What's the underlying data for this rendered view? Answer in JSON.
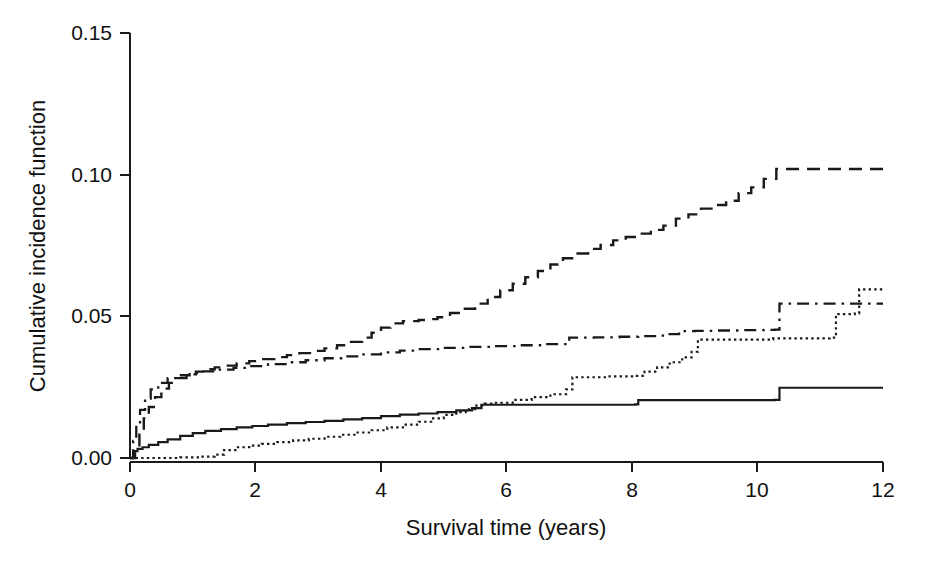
{
  "chart_data": {
    "type": "line",
    "title": "",
    "subtitle": "",
    "xlabel": "Survival time (years)",
    "ylabel": "Cumulative incidence function",
    "xlim": [
      0,
      12
    ],
    "ylim": [
      0.0,
      0.15
    ],
    "xticks": [
      0,
      2,
      4,
      6,
      8,
      10,
      12
    ],
    "xtick_labels": [
      "0",
      "2",
      "4",
      "6",
      "8",
      "10",
      "12"
    ],
    "yticks": [
      0.0,
      0.05,
      0.1,
      0.15
    ],
    "ytick_labels": [
      "0.00",
      "0.05",
      "0.10",
      "0.15"
    ],
    "grid": false,
    "legend": null,
    "legend_position": "none",
    "step_style": "post",
    "series": [
      {
        "name": "series-dashed",
        "line_style": "dashed",
        "color": "#1a1a1a",
        "final_value": 0.102,
        "x": [
          0,
          0.08,
          0.15,
          0.22,
          0.3,
          0.4,
          0.5,
          0.62,
          0.75,
          0.9,
          1.05,
          1.2,
          1.35,
          1.5,
          1.7,
          1.9,
          2.1,
          2.3,
          2.5,
          2.7,
          2.9,
          3.1,
          3.3,
          3.5,
          3.7,
          3.85,
          4.0,
          4.15,
          4.35,
          4.6,
          4.75,
          4.9,
          5.1,
          5.3,
          5.5,
          5.7,
          5.9,
          6.1,
          6.3,
          6.5,
          6.7,
          6.9,
          7.1,
          7.3,
          7.5,
          7.7,
          7.9,
          8.1,
          8.3,
          8.5,
          8.7,
          8.9,
          9.1,
          9.3,
          9.5,
          9.7,
          9.9,
          10.1,
          10.3,
          12
        ],
        "y": [
          0.0,
          0.004,
          0.009,
          0.014,
          0.018,
          0.0215,
          0.0245,
          0.0265,
          0.0282,
          0.0295,
          0.0305,
          0.0313,
          0.032,
          0.0326,
          0.0334,
          0.0342,
          0.0349,
          0.0356,
          0.0363,
          0.037,
          0.0378,
          0.0387,
          0.0398,
          0.041,
          0.0425,
          0.0442,
          0.046,
          0.0475,
          0.0483,
          0.0487,
          0.049,
          0.0497,
          0.0512,
          0.0527,
          0.0545,
          0.0568,
          0.0592,
          0.0615,
          0.0638,
          0.066,
          0.0683,
          0.0705,
          0.0722,
          0.0738,
          0.0752,
          0.0768,
          0.078,
          0.0792,
          0.0805,
          0.082,
          0.0845,
          0.086,
          0.088,
          0.0893,
          0.0908,
          0.0935,
          0.0955,
          0.0985,
          0.102,
          0.102
        ]
      },
      {
        "name": "series-dashdot",
        "line_style": "dashdot",
        "color": "#1a1a1a",
        "final_value": 0.0545,
        "x": [
          0,
          0.05,
          0.1,
          0.16,
          0.24,
          0.33,
          0.45,
          0.6,
          0.75,
          0.95,
          1.15,
          1.4,
          1.65,
          1.9,
          2.2,
          2.5,
          2.8,
          3.1,
          3.4,
          3.7,
          4.0,
          4.3,
          4.6,
          5.0,
          5.4,
          5.8,
          6.2,
          6.6,
          7.0,
          7.4,
          7.8,
          8.1,
          8.4,
          8.6,
          8.75,
          9.0,
          9.3,
          9.7,
          10.1,
          10.28,
          10.35,
          12
        ],
        "y": [
          0.0,
          0.006,
          0.012,
          0.017,
          0.021,
          0.0242,
          0.0265,
          0.0282,
          0.0292,
          0.03,
          0.0306,
          0.0312,
          0.0318,
          0.0324,
          0.0331,
          0.0338,
          0.0345,
          0.0352,
          0.0359,
          0.0366,
          0.0373,
          0.0379,
          0.0384,
          0.0389,
          0.0392,
          0.0395,
          0.0398,
          0.0402,
          0.0425,
          0.0426,
          0.0428,
          0.043,
          0.0432,
          0.0437,
          0.0448,
          0.0449,
          0.045,
          0.0451,
          0.0452,
          0.0453,
          0.0545,
          0.0545
        ]
      },
      {
        "name": "series-dotted",
        "line_style": "dotted",
        "color": "#1a1a1a",
        "final_value": 0.0595,
        "x": [
          0,
          0.4,
          0.8,
          1.1,
          1.35,
          1.5,
          1.7,
          1.9,
          2.1,
          2.35,
          2.6,
          2.85,
          3.1,
          3.35,
          3.6,
          3.85,
          4.1,
          4.35,
          4.6,
          4.8,
          5.0,
          5.2,
          5.35,
          5.5,
          5.65,
          5.8,
          6.1,
          6.4,
          6.7,
          6.95,
          7.05,
          7.6,
          8.05,
          8.2,
          8.4,
          8.6,
          8.8,
          8.95,
          9.05,
          10.25,
          11.15,
          11.25,
          11.55,
          11.62,
          12
        ],
        "y": [
          0.0,
          0.0,
          0.0002,
          0.0005,
          0.0012,
          0.0028,
          0.0038,
          0.0044,
          0.005,
          0.0056,
          0.0062,
          0.0068,
          0.0075,
          0.0082,
          0.009,
          0.0098,
          0.0108,
          0.0118,
          0.0128,
          0.014,
          0.0152,
          0.0162,
          0.0172,
          0.0185,
          0.0192,
          0.0195,
          0.0205,
          0.0215,
          0.0225,
          0.0242,
          0.0285,
          0.0288,
          0.029,
          0.0305,
          0.032,
          0.0338,
          0.0355,
          0.0375,
          0.0418,
          0.0422,
          0.0425,
          0.0508,
          0.051,
          0.0595,
          0.0595
        ]
      },
      {
        "name": "series-solid",
        "line_style": "solid",
        "color": "#1a1a1a",
        "final_value": 0.0248,
        "x": [
          0,
          0.06,
          0.12,
          0.2,
          0.3,
          0.45,
          0.6,
          0.8,
          1.0,
          1.2,
          1.45,
          1.7,
          1.95,
          2.2,
          2.5,
          2.8,
          3.1,
          3.4,
          3.7,
          4.0,
          4.3,
          4.6,
          4.9,
          5.2,
          5.45,
          5.6,
          8.05,
          8.1,
          10.28,
          10.35,
          12
        ],
        "y": [
          0.0,
          0.0024,
          0.0032,
          0.0038,
          0.0046,
          0.0056,
          0.0066,
          0.0078,
          0.0088,
          0.0096,
          0.0102,
          0.0108,
          0.0113,
          0.0118,
          0.0123,
          0.0127,
          0.0131,
          0.0136,
          0.0141,
          0.0148,
          0.0153,
          0.0157,
          0.0162,
          0.0168,
          0.0176,
          0.0188,
          0.0189,
          0.0204,
          0.0205,
          0.0248,
          0.0248
        ]
      }
    ]
  },
  "axes": {
    "x_axis_name": "survival-time-axis",
    "y_axis_name": "cumulative-incidence-axis"
  }
}
